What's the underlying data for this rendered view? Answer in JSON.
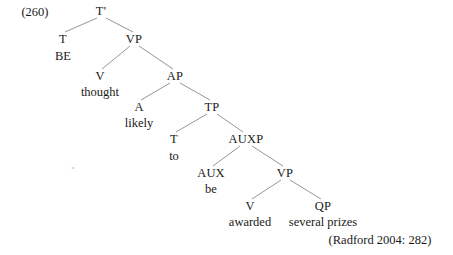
{
  "figure": {
    "example_number": "(260)",
    "citation": "(Radford 2004: 282)"
  },
  "tree": {
    "nodes": [
      {
        "id": "Tbar",
        "label": "T'",
        "x": 101,
        "y": 11
      },
      {
        "id": "T1",
        "label": "T",
        "x": 63,
        "y": 39
      },
      {
        "id": "VP1",
        "label": "VP",
        "x": 134,
        "y": 39
      },
      {
        "id": "V1",
        "label": "V",
        "x": 100,
        "y": 76
      },
      {
        "id": "AP",
        "label": "AP",
        "x": 175,
        "y": 76
      },
      {
        "id": "A",
        "label": "A",
        "x": 139,
        "y": 107
      },
      {
        "id": "TP",
        "label": "TP",
        "x": 212,
        "y": 107
      },
      {
        "id": "T2",
        "label": "T",
        "x": 174,
        "y": 139
      },
      {
        "id": "AUXP",
        "label": "AUXP",
        "x": 246,
        "y": 139
      },
      {
        "id": "AUX",
        "label": "AUX",
        "x": 211,
        "y": 173
      },
      {
        "id": "VP2",
        "label": "VP",
        "x": 285,
        "y": 173
      },
      {
        "id": "V2",
        "label": "V",
        "x": 250,
        "y": 206
      },
      {
        "id": "QP",
        "label": "QP",
        "x": 323,
        "y": 206
      }
    ],
    "terminals": [
      {
        "id": "be_word",
        "label": "BE",
        "x": 63,
        "y": 56
      },
      {
        "id": "thought_word",
        "label": "thought",
        "x": 100,
        "y": 92
      },
      {
        "id": "likely_word",
        "label": "likely",
        "x": 139,
        "y": 123
      },
      {
        "id": "to_word",
        "label": "to",
        "x": 174,
        "y": 156
      },
      {
        "id": "be_aux_word",
        "label": "be",
        "x": 211,
        "y": 189
      },
      {
        "id": "awarded_word",
        "label": "awarded",
        "x": 250,
        "y": 222
      },
      {
        "id": "prizes_words",
        "label": "several prizes",
        "x": 323,
        "y": 222
      }
    ],
    "branches": [
      {
        "from": "Tbar",
        "to": "T1",
        "x1": 97,
        "y1": 18,
        "x2": 65,
        "y2": 32
      },
      {
        "from": "Tbar",
        "to": "VP1",
        "x1": 106,
        "y1": 18,
        "x2": 133,
        "y2": 32
      },
      {
        "from": "VP1",
        "to": "V1",
        "x1": 130,
        "y1": 46,
        "x2": 102,
        "y2": 69
      },
      {
        "from": "VP1",
        "to": "AP",
        "x1": 139,
        "y1": 46,
        "x2": 173,
        "y2": 69
      },
      {
        "from": "AP",
        "to": "A",
        "x1": 170,
        "y1": 83,
        "x2": 141,
        "y2": 100
      },
      {
        "from": "AP",
        "to": "TP",
        "x1": 180,
        "y1": 83,
        "x2": 210,
        "y2": 100
      },
      {
        "from": "TP",
        "to": "T2",
        "x1": 207,
        "y1": 114,
        "x2": 176,
        "y2": 132
      },
      {
        "from": "TP",
        "to": "AUXP",
        "x1": 217,
        "y1": 114,
        "x2": 243,
        "y2": 132
      },
      {
        "from": "AUXP",
        "to": "AUX",
        "x1": 240,
        "y1": 146,
        "x2": 213,
        "y2": 166
      },
      {
        "from": "AUXP",
        "to": "VP2",
        "x1": 252,
        "y1": 146,
        "x2": 283,
        "y2": 166
      },
      {
        "from": "VP2",
        "to": "V2",
        "x1": 281,
        "y1": 180,
        "x2": 252,
        "y2": 199
      },
      {
        "from": "VP2",
        "to": "QP",
        "x1": 290,
        "y1": 180,
        "x2": 321,
        "y2": 199
      }
    ]
  },
  "artifacts": [
    {
      "id": "scan-speck",
      "x": 73,
      "y": 168
    }
  ],
  "layout": {
    "example_number_x": 35,
    "example_number_y": 12,
    "citation_x": 380,
    "citation_y": 240,
    "line_color": "#8a8a8a",
    "text_color": "#1a1a1a",
    "background": "#ffffff"
  }
}
